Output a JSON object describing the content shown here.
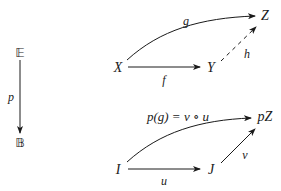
{
  "fibration": {
    "total_category": "𝔼",
    "base_category": "𝔹",
    "functor_label": "p"
  },
  "upper_diagram": {
    "objects": {
      "source": "X",
      "middle": "Y",
      "target": "Z"
    },
    "morphisms": {
      "f": "f",
      "g": "g",
      "h": "h"
    },
    "h_style": "dashed"
  },
  "lower_diagram": {
    "objects": {
      "source": "I",
      "middle": "J",
      "target": "pZ"
    },
    "morphisms": {
      "u": "u",
      "v": "v",
      "pg": "p(g) = v ∘ u"
    }
  },
  "colors": {
    "stroke": "#1a1a1a",
    "background": "#ffffff"
  }
}
